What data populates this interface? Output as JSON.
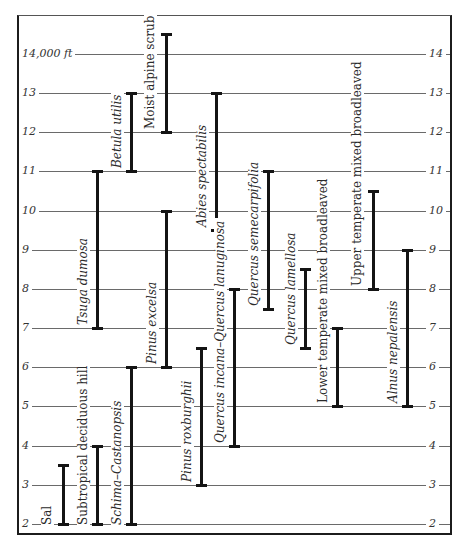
{
  "chart_data": {
    "type": "range",
    "title": "",
    "xlabel": "",
    "ylabel": "Altitude (ft)",
    "y_unit_note": "14,000 ft",
    "ylim": [
      2,
      14.5
    ],
    "yticks_left": [
      "2",
      "3",
      "4",
      "5",
      "6",
      "7",
      "8",
      "9",
      "10",
      "11",
      "12",
      "13",
      "14,000 ft"
    ],
    "yticks_right": [
      "2",
      "3",
      "4",
      "5",
      "6",
      "7",
      "8",
      "9",
      "10",
      "11",
      "12",
      "13",
      "14"
    ],
    "grid": true,
    "series": [
      {
        "name": "Sal",
        "low": 2,
        "high": 3.5,
        "italic": false
      },
      {
        "name": "Subtropical deciduous hill",
        "low": 2,
        "high": 4,
        "italic": false
      },
      {
        "name": "Tsuga dumosa",
        "low": 7,
        "high": 11,
        "italic": true
      },
      {
        "name": "Schima–Castanopsis",
        "low": 2,
        "high": 6,
        "italic": true
      },
      {
        "name": "Betula utilis",
        "low": 11,
        "high": 13,
        "italic": true
      },
      {
        "name": "Pinus excelsa",
        "low": 6,
        "high": 10,
        "italic": true
      },
      {
        "name": "Moist alpine scrub",
        "low": 12,
        "high": 14.5,
        "italic": false
      },
      {
        "name": "Pinus roxburghii",
        "low": 3,
        "high": 6.5,
        "italic": true
      },
      {
        "name": "Abies spectabilis",
        "low": 9.5,
        "high": 13,
        "italic": true
      },
      {
        "name": "Quercus incana–Quercus lanuginosa",
        "low": 4,
        "high": 8,
        "italic": true
      },
      {
        "name": "Quercus semecarpifolia",
        "low": 7.5,
        "high": 11,
        "italic": true
      },
      {
        "name": "Quercus lamellosa",
        "low": 6.5,
        "high": 8.5,
        "italic": true
      },
      {
        "name": "Lower temperate mixed broadleaved",
        "low": 5,
        "high": 7,
        "italic": false
      },
      {
        "name": "Upper temperate mixed broadleaved",
        "low": 8,
        "high": 10.5,
        "italic": false
      },
      {
        "name": "Alnus nepalensis",
        "low": 5,
        "high": 9,
        "italic": true
      }
    ]
  }
}
